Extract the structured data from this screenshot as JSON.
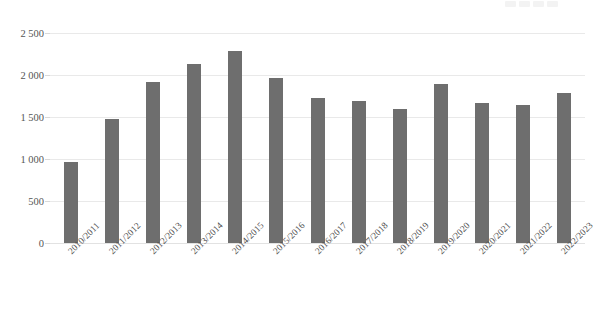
{
  "chart_data": {
    "type": "bar",
    "title": "",
    "subtitle": "",
    "xlabel": "",
    "ylabel": "",
    "categories": [
      "2010/2011",
      "2011/2012",
      "2012/2013",
      "2013/2014",
      "2014/2015",
      "2015/2016",
      "2016/2017",
      "2017/2018",
      "2018/2019",
      "2019/2020",
      "2020/2021",
      "2021/2022",
      "2022/2023"
    ],
    "values": [
      965,
      1480,
      1920,
      2130,
      2285,
      1965,
      1725,
      1695,
      1600,
      1895,
      1670,
      1640,
      1785
    ],
    "ylim": [
      0,
      2500
    ],
    "ytick_values": [
      0,
      500,
      1000,
      1500,
      2000,
      2500
    ],
    "ytick_labels": [
      "0",
      "500",
      "1 000",
      "1 500",
      "2 000",
      "2 500"
    ],
    "grid": true,
    "legend": false,
    "legend_position": "none",
    "bar_color": "#6e6e6e",
    "gridline_color": "#e9e9e9",
    "background_color": "#ffffff",
    "axis_text_color": "#4f4f4f"
  },
  "axes": {
    "y_axis_name": "y-axis",
    "x_axis_name": "x-axis"
  }
}
